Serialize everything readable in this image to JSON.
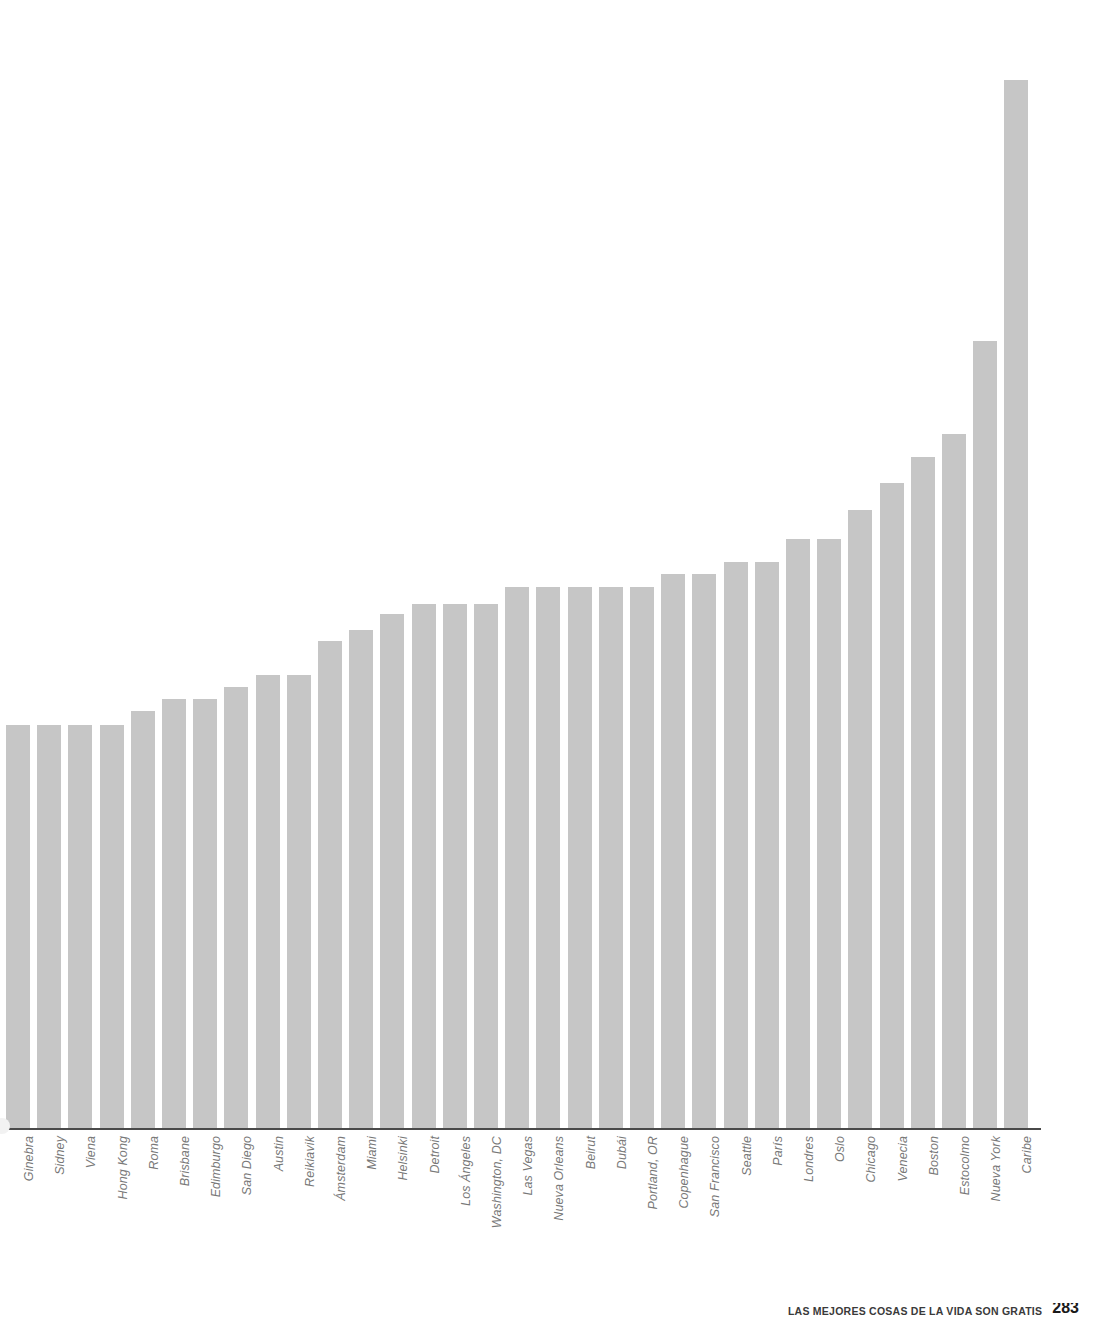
{
  "figure": {
    "name": "city-ranking-bar-chart",
    "bar_color": "#c6c6c6",
    "axis_color": "#4a4a4a",
    "label_color": "#787878",
    "background": "#ffffff"
  },
  "footer": {
    "caption": "LAS MEJORES COSAS DE LA VIDA SON GRATIS",
    "page_number": "283"
  },
  "chart_data": {
    "type": "bar",
    "title": "",
    "subtitle": "",
    "xlabel": "",
    "ylabel": "",
    "grid": false,
    "legend": "none",
    "orientation": "vertical",
    "sorted": "ascending",
    "ylim": [
      0,
      100
    ],
    "categories": [
      "Ginebra",
      "Sidney",
      "Viena",
      "Hong Kong",
      "Roma",
      "Brisbane",
      "Edimburgo",
      "San Diego",
      "Austin",
      "Reikiavik",
      "Ámsterdam",
      "Miami",
      "Helsinki",
      "Detroit",
      "Los Ángeles",
      "Washington, DC",
      "Las Vegas",
      "Nueva Orleans",
      "Beirut",
      "Dubái",
      "Portland, OR",
      "Copenhague",
      "San Francisco",
      "Seattle",
      "París",
      "Londres",
      "Oslo",
      "Chicago",
      "Venecia",
      "Boston",
      "Estocolmo",
      "Nueva York",
      "Caribe"
    ],
    "values": [
      37.2,
      37.2,
      37.2,
      37.2,
      38.4,
      39.5,
      39.5,
      40.6,
      41.7,
      41.7,
      44.9,
      45.9,
      47.3,
      48.3,
      48.3,
      48.3,
      49.8,
      49.8,
      49.8,
      49.8,
      49.8,
      51.0,
      51.0,
      52.1,
      52.1,
      54.2,
      54.2,
      56.9,
      59.4,
      61.7,
      63.9,
      72.4,
      96.3
    ]
  }
}
